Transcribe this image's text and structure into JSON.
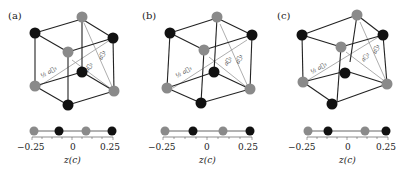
{
  "figure": {
    "panels": [
      {
        "label": "(a)",
        "vectors": [
          "½ a⃗₃",
          "a⃗₂",
          "a⃗₁"
        ],
        "chain_positions": [
          -0.25,
          -0.083,
          0.083,
          0.25
        ],
        "chain_colors": [
          "gray",
          "black",
          "gray",
          "black"
        ]
      },
      {
        "label": "(b)",
        "vectors": [
          "½ a⃗₃",
          "a⃗₂",
          "a⃗₁"
        ],
        "chain_positions": [
          -0.25,
          -0.07,
          0.1,
          0.25
        ],
        "chain_colors": [
          "gray",
          "black",
          "gray",
          "black"
        ]
      },
      {
        "label": "(c)",
        "vectors": [
          "½ a⃗₃",
          "a⃗₂",
          "a⃗₁"
        ],
        "chain_positions": [
          -0.25,
          -0.12,
          0.12,
          0.25
        ],
        "chain_colors": [
          "gray",
          "black",
          "gray",
          "black"
        ]
      }
    ],
    "axis": {
      "ticks": [
        "−0.25",
        "0",
        "0.25"
      ],
      "xlabel": "z(c)"
    },
    "colors": {
      "gray_atom": "#8a8a8a",
      "black_atom": "#111111",
      "edge": "#222222",
      "vector": "#999999"
    }
  }
}
